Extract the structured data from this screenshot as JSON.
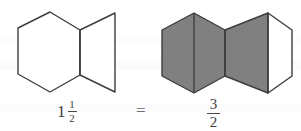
{
  "figure": {
    "stroke_color": "#3d3d3d",
    "fill_gray": "#808080",
    "fill_white": "#ffffff",
    "background": "#ffffff"
  },
  "left_model": {
    "name": "outline-hexagon-model",
    "description": "One whole hexagon plus one half hexagon, drawn as outlines",
    "shapes": [
      {
        "id": "whole-hexagon-outline",
        "label": "whole hexagon",
        "fill": "#ffffff",
        "points": "18,28 50,12 80,30 80,75 50,92 18,74"
      },
      {
        "id": "half-hexagon-outline",
        "label": "half hexagon",
        "fill": "#ffffff",
        "points": "80,30 115,13 115,92 80,75"
      }
    ],
    "divider": {
      "id": "outline-divider",
      "x1": 80,
      "y1": 30,
      "x2": 80,
      "y2": 75
    }
  },
  "right_model": {
    "name": "shaded-hexagon-model",
    "description": "Three shaded halves out of halves of a hexagon: full gray hexagon plus a half-shaded hexagon",
    "shapes": [
      {
        "id": "shaded-hexagon-left",
        "label": "shaded whole hexagon",
        "fill": "#808080",
        "points": "162,30 194,13 225,30 225,76 194,93 162,76"
      },
      {
        "id": "shaded-half-wedge",
        "label": "shaded half hexagon",
        "fill": "#808080",
        "points": "225,30 268,13 268,93 225,76"
      },
      {
        "id": "unshaded-half",
        "label": "unshaded half hexagon",
        "fill": "#ffffff",
        "points": "268,13 292,30 292,76 268,93"
      }
    ],
    "dividers": [
      {
        "id": "divider-1",
        "x1": 194,
        "y1": 13,
        "x2": 194,
        "y2": 93
      },
      {
        "id": "divider-2",
        "x1": 225,
        "y1": 30,
        "x2": 225,
        "y2": 76
      },
      {
        "id": "divider-3",
        "x1": 268,
        "y1": 13,
        "x2": 268,
        "y2": 93
      }
    ]
  },
  "labels": {
    "mixed_number": {
      "whole": "1",
      "numerator": "1",
      "denominator": "2",
      "reading": "1 1/2"
    },
    "equals": "=",
    "improper_fraction": {
      "numerator": "3",
      "denominator": "2",
      "reading": "3/2"
    }
  }
}
